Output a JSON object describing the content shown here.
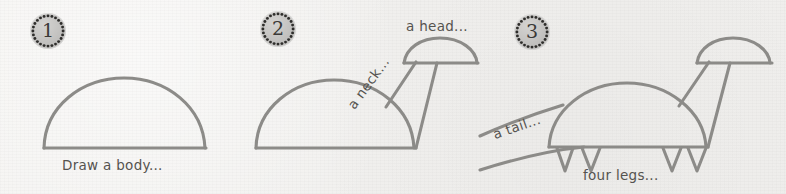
{
  "page": {
    "background_color": "#f3f2f0",
    "ink_color": "#8c8b88",
    "text_color": "#55534f",
    "badge_color": "#c2c1bf",
    "width": 786,
    "height": 194
  },
  "steps": [
    {
      "number": "1",
      "badge_name": "step-1-badge",
      "captions": [
        {
          "text": "Draw a body...",
          "name": "caption-draw-a-body"
        }
      ]
    },
    {
      "number": "2",
      "badge_name": "step-2-badge",
      "captions": [
        {
          "text": "a neck...",
          "name": "caption-a-neck"
        },
        {
          "text": "a head...",
          "name": "caption-a-head"
        }
      ]
    },
    {
      "number": "3",
      "badge_name": "step-3-badge",
      "captions": [
        {
          "text": "a tail...",
          "name": "caption-a-tail"
        },
        {
          "text": "four legs...",
          "name": "caption-four-legs"
        }
      ]
    }
  ]
}
